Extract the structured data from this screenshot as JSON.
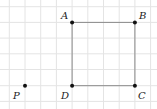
{
  "diagram": {
    "type": "grid-geometry",
    "grid": {
      "x_lines": [
        9.3,
        25,
        40.7,
        56.4,
        72.1,
        87.8,
        103.5,
        119.2,
        134.9,
        150.6
      ],
      "y_lines": [
        6.7,
        22.4,
        38.1,
        53.8,
        69.5,
        85.7,
        101.4
      ],
      "color": "#e4e4e4"
    },
    "square": {
      "stroke": "#8a8a8a",
      "vertices": [
        "A",
        "B",
        "C",
        "D"
      ]
    },
    "points": [
      {
        "id": "A",
        "label": "A",
        "x": 72.1,
        "y": 22.4,
        "lx": 61,
        "ly": 19
      },
      {
        "id": "B",
        "label": "B",
        "x": 134.9,
        "y": 22.4,
        "lx": 139,
        "ly": 19
      },
      {
        "id": "C",
        "label": "C",
        "x": 134.9,
        "y": 85.7,
        "lx": 138,
        "ly": 99
      },
      {
        "id": "D",
        "label": "D",
        "x": 72.1,
        "y": 85.7,
        "lx": 61,
        "ly": 99
      },
      {
        "id": "P",
        "label": "P",
        "x": 25,
        "y": 85.7,
        "lx": 13,
        "ly": 99
      }
    ],
    "point_color": "#111111"
  }
}
